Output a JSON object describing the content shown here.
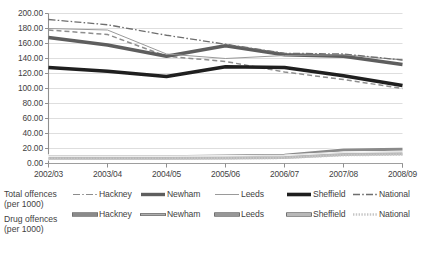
{
  "chart_data": {
    "type": "line",
    "title": "",
    "xlabel": "",
    "ylabel": "",
    "ylim": [
      0,
      200
    ],
    "ytick_step": 20,
    "grid": true,
    "legend_position": "bottom",
    "categories": [
      "2002/03",
      "2003/04",
      "2004/05",
      "2005/06",
      "2006/07",
      "2007/08",
      "2008/09"
    ],
    "ytick_labels": [
      "200.00",
      "180.00",
      "160.00",
      "140.00",
      "120.00",
      "100.00",
      "80.00",
      "60.00",
      "40.00",
      "20.00",
      "0.00"
    ],
    "series": [
      {
        "name": "Hackney",
        "group": "Total offences (per 1000)",
        "style": "dash-dot-thin",
        "color": "#8c8c8c",
        "values": [
          178.0,
          172.0,
          143.0,
          136.0,
          122.0,
          112.0,
          100.0
        ]
      },
      {
        "name": "Newham",
        "group": "Total offences (per 1000)",
        "style": "solid-thick",
        "color": "#5a5a5a",
        "values": [
          168.0,
          158.0,
          143.0,
          157.0,
          145.0,
          143.0,
          132.0
        ]
      },
      {
        "name": "Leeds",
        "group": "Total offences (per 1000)",
        "style": "solid-thin-open",
        "color": "#9a9a9a",
        "values": [
          180.0,
          178.0,
          146.0,
          140.0,
          144.0,
          145.0,
          138.0
        ]
      },
      {
        "name": "Sheffield",
        "group": "Total offences (per 1000)",
        "style": "solid-thick-black",
        "color": "#1f1f1f",
        "values": [
          128.0,
          123.0,
          116.0,
          129.0,
          128.0,
          117.0,
          104.0
        ]
      },
      {
        "name": "National",
        "group": "Total offences (per 1000)",
        "style": "dash-dot",
        "color": "#6e6e6e",
        "values": [
          192.0,
          185.0,
          171.0,
          159.0,
          147.0,
          146.0,
          138.0
        ]
      },
      {
        "name": "Hackney",
        "group": "Drug offences (per 1000)",
        "style": "solid-thick-grey",
        "color": "#8a8a8a",
        "values": [
          9.0,
          9.0,
          9.0,
          10.0,
          11.0,
          18.0,
          19.0
        ]
      },
      {
        "name": "Newham",
        "group": "Drug offences (per 1000)",
        "style": "solid-thin-open-grey",
        "color": "#a8a8a8",
        "values": [
          7.0,
          7.0,
          7.0,
          7.0,
          8.0,
          12.0,
          13.0
        ]
      },
      {
        "name": "Leeds",
        "group": "Drug offences (per 1000)",
        "style": "solid-thick-midgrey",
        "color": "#979797",
        "values": [
          7.5,
          7.5,
          7.5,
          8.0,
          9.0,
          13.0,
          14.0
        ]
      },
      {
        "name": "Sheffield",
        "group": "Drug offences (per 1000)",
        "style": "solid-thick-lightgrey",
        "color": "#b4b4b4",
        "values": [
          7.0,
          7.0,
          7.0,
          7.5,
          8.0,
          12.0,
          13.0
        ]
      },
      {
        "name": "National",
        "group": "Drug offences (per 1000)",
        "style": "dotted-light",
        "color": "#c2c2c2",
        "values": [
          6.5,
          6.5,
          6.5,
          7.0,
          7.5,
          11.0,
          12.0
        ]
      }
    ],
    "dashed_total_series_note": ""
  },
  "legend": {
    "groups": [
      {
        "label_line1": "Total offences",
        "label_line2": "(per 1000)"
      },
      {
        "label_line1": "Drug offences",
        "label_line2": "(per 1000)"
      }
    ],
    "row1": [
      {
        "name": "Hackney",
        "swatch": "dash-dot-thin"
      },
      {
        "name": "Newham",
        "swatch": "solid-thick"
      },
      {
        "name": "Leeds",
        "swatch": "solid-thin-open"
      },
      {
        "name": "Sheffield",
        "swatch": "solid-thick-black"
      },
      {
        "name": "National",
        "swatch": "dash-dot"
      }
    ],
    "row2": [
      {
        "name": "Hackney",
        "swatch": "solid-thick-grey"
      },
      {
        "name": "Newham",
        "swatch": "solid-thin-open-grey"
      },
      {
        "name": "Leeds",
        "swatch": "solid-thick-midgrey"
      },
      {
        "name": "Sheffield",
        "swatch": "solid-thick-lightgrey"
      },
      {
        "name": "National",
        "swatch": "dotted-light"
      }
    ]
  }
}
